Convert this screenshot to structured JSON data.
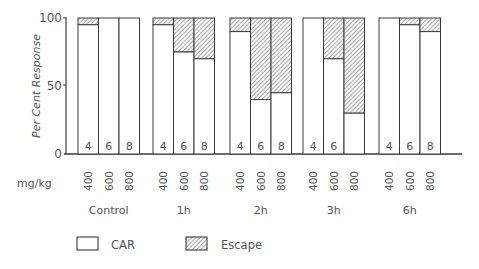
{
  "chart_data": {
    "type": "bar",
    "stacked": true,
    "title": "",
    "ylabel": "Per Cent Response",
    "xlabel": "mg/kg",
    "ylim": [
      0,
      100
    ],
    "yticks": [
      0,
      50,
      100
    ],
    "groups": [
      "Control",
      "1h",
      "2h",
      "3h",
      "6h"
    ],
    "doses": [
      "400",
      "600",
      "800"
    ],
    "categories": [
      "Control 400",
      "Control 600",
      "Control 800",
      "1h 400",
      "1h 600",
      "1h 800",
      "2h 400",
      "2h 600",
      "2h 800",
      "3h 400",
      "3h 600",
      "3h 800",
      "6h 400",
      "6h 600",
      "6h 800"
    ],
    "series": [
      {
        "name": "CAR",
        "fill": "white",
        "values": [
          95,
          100,
          100,
          95,
          75,
          70,
          90,
          40,
          45,
          100,
          70,
          30,
          100,
          95,
          90
        ]
      },
      {
        "name": "Escape",
        "fill": "hatched",
        "values": [
          5,
          0,
          0,
          5,
          25,
          30,
          10,
          60,
          55,
          0,
          30,
          70,
          0,
          5,
          10
        ]
      }
    ],
    "bar_labels": [
      "4",
      "6",
      "8",
      "4",
      "6",
      "8",
      "4",
      "6",
      "8",
      "4",
      "6",
      "",
      "4",
      "6",
      "8"
    ],
    "legend": [
      {
        "label": "CAR",
        "fill": "white"
      },
      {
        "label": "Escape",
        "fill": "hatched"
      }
    ],
    "legend_position": "bottom",
    "grid": false
  },
  "axis": {
    "y_label": "Per Cent Response",
    "x_unit_label": "mg/kg",
    "ytick_labels": [
      "0",
      "50",
      "100"
    ]
  },
  "colors": {
    "line": "#3a3a3a",
    "hatch": "#5a5a5a",
    "text": "#555555"
  }
}
